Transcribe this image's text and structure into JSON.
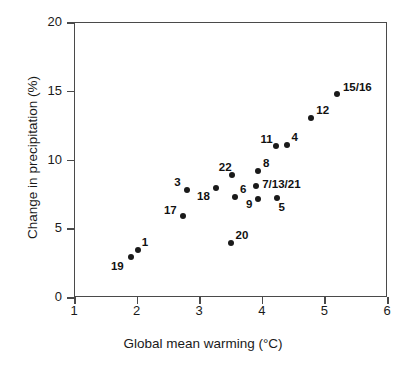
{
  "chart_data": {
    "type": "scatter",
    "title": "",
    "xlabel": "Global mean warming (°C)",
    "ylabel": "Change in precipitation (%)",
    "xlim": [
      1,
      6
    ],
    "ylim": [
      0,
      20
    ],
    "xticks": [
      "1",
      "2",
      "3",
      "4",
      "5",
      "6"
    ],
    "yticks": [
      "0",
      "5",
      "10",
      "15",
      "20"
    ],
    "grid": false,
    "legend": "none",
    "marker_color": "#1a1a1a",
    "axis_color": "#4a4a4a",
    "points": [
      {
        "label": "19",
        "x": 1.91,
        "y": 2.9,
        "lx": -20,
        "ly": 3
      },
      {
        "label": "1",
        "x": 2.02,
        "y": 3.42,
        "lx": 4,
        "ly": -14
      },
      {
        "label": "17",
        "x": 2.74,
        "y": 5.9,
        "lx": -19,
        "ly": -12
      },
      {
        "label": "3",
        "x": 2.81,
        "y": 7.78,
        "lx": -13,
        "ly": -14
      },
      {
        "label": "18",
        "x": 3.27,
        "y": 7.94,
        "lx": -19,
        "ly": 2
      },
      {
        "label": "22",
        "x": 3.52,
        "y": 8.87,
        "lx": -13,
        "ly": -14
      },
      {
        "label": "6",
        "x": 3.57,
        "y": 7.27,
        "lx": 5,
        "ly": -14
      },
      {
        "label": "20",
        "x": 3.5,
        "y": 3.93,
        "lx": 5,
        "ly": -14
      },
      {
        "label": "9",
        "x": 3.94,
        "y": 7.13,
        "lx": -12,
        "ly": -1
      },
      {
        "label": "7/13/21",
        "x": 3.91,
        "y": 8.07,
        "lx": 6,
        "ly": -8
      },
      {
        "label": "8",
        "x": 3.94,
        "y": 9.16,
        "lx": 5,
        "ly": -14
      },
      {
        "label": "5",
        "x": 4.25,
        "y": 7.2,
        "lx": 1,
        "ly": 3
      },
      {
        "label": "11",
        "x": 4.22,
        "y": 10.98,
        "lx": -15,
        "ly": -13
      },
      {
        "label": "4",
        "x": 4.41,
        "y": 11.05,
        "lx": 4,
        "ly": -14
      },
      {
        "label": "12",
        "x": 4.79,
        "y": 13.05,
        "lx": 5,
        "ly": -14
      },
      {
        "label": "15/16",
        "x": 5.2,
        "y": 14.78,
        "lx": 6,
        "ly": -13
      }
    ]
  }
}
